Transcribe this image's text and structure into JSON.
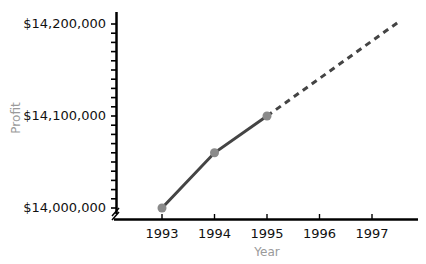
{
  "chart_data": {
    "type": "line",
    "title": "",
    "xlabel": "Year",
    "ylabel": "Profit",
    "categories": [
      "1993",
      "1994",
      "1995",
      "1996",
      "1997"
    ],
    "series": [
      {
        "name": "Actual profit",
        "style": "solid",
        "x": [
          1993,
          1994,
          1995
        ],
        "values": [
          14000000,
          14060000,
          14100000
        ],
        "color": "#444444",
        "marker_color": "#8a8a8a"
      },
      {
        "name": "Projected profit",
        "style": "dashed",
        "x": [
          1995,
          1997.5
        ],
        "values": [
          14100000,
          14202000
        ],
        "color": "#444444"
      }
    ],
    "y_tick_labels": [
      "$14,000,000",
      "$14,100,000",
      "$14,200,000"
    ],
    "y_tick_values": [
      14000000,
      14100000,
      14200000
    ],
    "y_minor_tick_step": 10000,
    "ylim": [
      14000000,
      14200000
    ],
    "xlim": [
      1993,
      1997.8
    ],
    "y_axis_break": true,
    "grid": false,
    "legend": null
  }
}
